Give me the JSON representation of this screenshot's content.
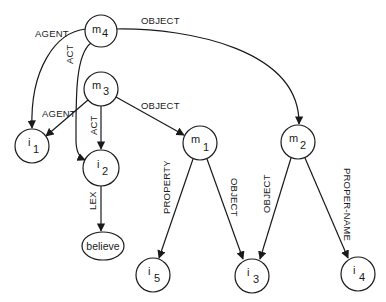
{
  "diagram": {
    "type": "semantic-network",
    "nodes": [
      {
        "id": "m4",
        "base": "m",
        "sub": "4",
        "shape": "circle",
        "cx": 101,
        "cy": 31,
        "r": 16
      },
      {
        "id": "m3",
        "base": "m",
        "sub": "3",
        "shape": "circle",
        "cx": 101,
        "cy": 89,
        "r": 17
      },
      {
        "id": "m1",
        "base": "m",
        "sub": "1",
        "shape": "circle",
        "cx": 200,
        "cy": 143,
        "r": 17
      },
      {
        "id": "m2",
        "base": "m",
        "sub": "2",
        "shape": "circle",
        "cx": 298,
        "cy": 142,
        "r": 17
      },
      {
        "id": "i1",
        "base": "i",
        "sub": "1",
        "shape": "circle",
        "cx": 32,
        "cy": 146,
        "r": 17
      },
      {
        "id": "i2",
        "base": "i",
        "sub": "2",
        "shape": "circle",
        "cx": 101,
        "cy": 168,
        "r": 18
      },
      {
        "id": "i5",
        "base": "i",
        "sub": "5",
        "shape": "circle",
        "cx": 153,
        "cy": 275,
        "r": 17
      },
      {
        "id": "i3",
        "base": "i",
        "sub": "3",
        "shape": "circle",
        "cx": 252,
        "cy": 276,
        "r": 17
      },
      {
        "id": "i4",
        "base": "i",
        "sub": "4",
        "shape": "circle",
        "cx": 358,
        "cy": 274,
        "r": 17
      },
      {
        "id": "believe",
        "label": "believe",
        "shape": "ellipse",
        "cx": 103,
        "cy": 246,
        "rx": 21,
        "ry": 14
      }
    ],
    "edges": [
      {
        "from": "m4",
        "to": "i1",
        "label": "AGENT"
      },
      {
        "from": "m4",
        "to": "i2",
        "label": "ACT"
      },
      {
        "from": "m4",
        "to": "m2",
        "label": "OBJECT"
      },
      {
        "from": "m3",
        "to": "i1",
        "label": "AGENT"
      },
      {
        "from": "m3",
        "to": "i2",
        "label": "ACT"
      },
      {
        "from": "m3",
        "to": "m1",
        "label": "OBJECT"
      },
      {
        "from": "i2",
        "to": "believe",
        "label": "LEX"
      },
      {
        "from": "m1",
        "to": "i5",
        "label": "PROPERTY"
      },
      {
        "from": "m1",
        "to": "i3",
        "label": "OBJECT"
      },
      {
        "from": "m2",
        "to": "i3",
        "label": "OBJECT"
      },
      {
        "from": "m2",
        "to": "i4",
        "label": "PROPER-NAME"
      }
    ]
  },
  "labels": {
    "m4_base": "m",
    "m4_sub": "4",
    "m3_base": "m",
    "m3_sub": "3",
    "m1_base": "m",
    "m1_sub": "1",
    "m2_base": "m",
    "m2_sub": "2",
    "i1_base": "i",
    "i1_sub": "1",
    "i2_base": "i",
    "i2_sub": "2",
    "i5_base": "i",
    "i5_sub": "5",
    "i3_base": "i",
    "i3_sub": "3",
    "i4_base": "i",
    "i4_sub": "4",
    "believe": "believe",
    "edge_m4_i1": "AGENT",
    "edge_m4_i2": "ACT",
    "edge_m4_m2": "OBJECT",
    "edge_m3_i1": "AGENT",
    "edge_m3_i2": "ACT",
    "edge_m3_m1": "OBJECT",
    "edge_i2_believe": "LEX",
    "edge_m1_i5": "PROPERTY",
    "edge_m1_i3": "OBJECT",
    "edge_m2_i3": "OBJECT",
    "edge_m2_i4": "PROPER-NAME"
  },
  "colors": {
    "stroke": "#1a1a1a",
    "background": "#ffffff"
  }
}
